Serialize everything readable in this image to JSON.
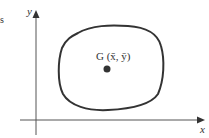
{
  "diagram": {
    "edge_fragment": "s",
    "y_axis_label": "y",
    "x_axis_label": "x",
    "centroid_label": "G (x̄, ȳ)",
    "colors": {
      "stroke": "#333333",
      "axis": "#555555",
      "dot": "#333333",
      "background": "#ffffff"
    }
  }
}
